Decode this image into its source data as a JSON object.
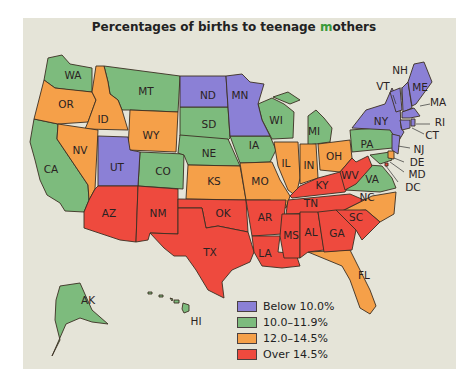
{
  "title": {
    "prefix": "Percentages of births to teenage ",
    "highlight": "m",
    "suffix": "others"
  },
  "colors": {
    "background": "#e5e4d8",
    "below_10": "#8b80d6",
    "10_to_11_9": "#7dbb7d",
    "12_to_14_5": "#f5a049",
    "over_14_5": "#ee4a3e"
  },
  "legend": [
    {
      "label": "Below 10.0%",
      "color": "#8b80d6"
    },
    {
      "label": "10.0–11.9%",
      "color": "#7dbb7d"
    },
    {
      "label": "12.0–14.5%",
      "color": "#f5a049"
    },
    {
      "label": "Over 14.5%",
      "color": "#ee4a3e"
    }
  ],
  "states": {
    "WA": "10.0–11.9%",
    "OR": "12.0–14.5%",
    "CA": "10.0–11.9%",
    "NV": "12.0–14.5%",
    "ID": "12.0–14.5%",
    "MT": "10.0–11.9%",
    "WY": "12.0–14.5%",
    "UT": "Below 10.0%",
    "CO": "10.0–11.9%",
    "AZ": "Over 14.5%",
    "NM": "Over 14.5%",
    "ND": "Below 10.0%",
    "SD": "10.0–11.9%",
    "NE": "10.0–11.9%",
    "KS": "12.0–14.5%",
    "OK": "Over 14.5%",
    "TX": "Over 14.5%",
    "MN": "Below 10.0%",
    "IA": "10.0–11.9%",
    "MO": "12.0–14.5%",
    "AR": "Over 14.5%",
    "LA": "Over 14.5%",
    "WI": "10.0–11.9%",
    "IL": "12.0–14.5%",
    "MI": "10.0–11.9%",
    "IN": "12.0–14.5%",
    "OH": "12.0–14.5%",
    "KY": "Over 14.5%",
    "TN": "Over 14.5%",
    "MS": "Over 14.5%",
    "AL": "Over 14.5%",
    "GA": "Over 14.5%",
    "FL": "12.0–14.5%",
    "SC": "Over 14.5%",
    "NC": "12.0–14.5%",
    "VA": "10.0–11.9%",
    "WV": "Over 14.5%",
    "PA": "10.0–11.9%",
    "NY": "Below 10.0%",
    "VT": "Below 10.0%",
    "NH": "Below 10.0%",
    "ME": "Below 10.0%",
    "MA": "Below 10.0%",
    "RI": "Below 10.0%",
    "CT": "Below 10.0%",
    "NJ": "Below 10.0%",
    "DE": "12.0–14.5%",
    "MD": "10.0–11.9%",
    "DC": "Over 14.5%",
    "AK": "10.0–11.9%",
    "HI": "10.0–11.9%"
  },
  "labels": {
    "WA": "WA",
    "OR": "OR",
    "CA": "CA",
    "NV": "NV",
    "ID": "ID",
    "MT": "MT",
    "WY": "WY",
    "UT": "UT",
    "CO": "CO",
    "AZ": "AZ",
    "NM": "NM",
    "ND": "ND",
    "SD": "SD",
    "NE": "NE",
    "KS": "KS",
    "OK": "OK",
    "TX": "TX",
    "MN": "MN",
    "IA": "IA",
    "MO": "MO",
    "AR": "AR",
    "LA": "LA",
    "WI": "WI",
    "IL": "IL",
    "MI": "MI",
    "IN": "IN",
    "OH": "OH",
    "KY": "KY",
    "TN": "TN",
    "MS": "MS",
    "AL": "AL",
    "GA": "GA",
    "FL": "FL",
    "SC": "SC",
    "NC": "NC",
    "VA": "VA",
    "WV": "WV",
    "PA": "PA",
    "NY": "NY",
    "VT": "VT",
    "NH": "NH",
    "ME": "ME",
    "MA": "MA",
    "RI": "RI",
    "CT": "CT",
    "NJ": "NJ",
    "DE": "DE",
    "MD": "MD",
    "DC": "DC",
    "AK": "AK",
    "HI": "HI"
  }
}
